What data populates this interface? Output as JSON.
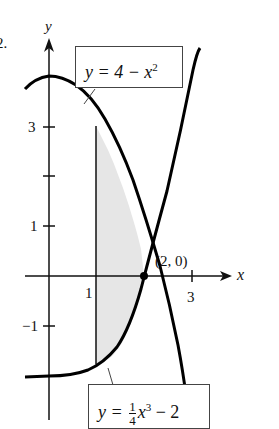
{
  "problem_number": "2.",
  "axes": {
    "x_label": "x",
    "y_label": "y",
    "x_ticks": [
      "1",
      "3"
    ],
    "y_ticks": [
      "3",
      "1",
      "−1"
    ]
  },
  "curves": {
    "top": {
      "label_lhs": "y = 4 − x",
      "label_exp": "2",
      "equation": "y = 4 - x^2"
    },
    "bottom": {
      "label_lhs": "y =",
      "frac_num": "1",
      "frac_den": "4",
      "label_var": "x",
      "label_exp": "3",
      "label_tail": " − 2",
      "equation": "y = (1/4)x^3 - 2"
    }
  },
  "intersection": {
    "label": "(2, 0)"
  },
  "shaded_region": {
    "x_from": 1,
    "x_to": 2,
    "fill": "#e6e6e6"
  },
  "colors": {
    "curve": "#000000",
    "axis": "#111111",
    "shade": "#e6e6e6"
  }
}
